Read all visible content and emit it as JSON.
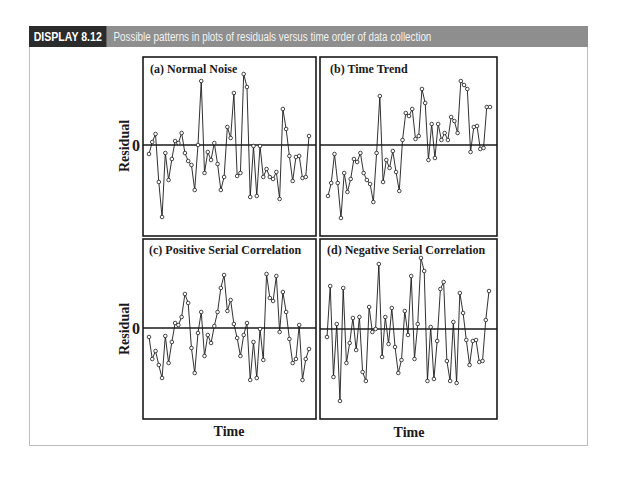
{
  "header": {
    "tag": "DISPLAY 8.12",
    "caption": "Possible patterns in plots of residuals versus time order of data collection"
  },
  "axes": {
    "ylabel": "Residual",
    "xlabel": "Time",
    "zero_tick": "0"
  },
  "colors": {
    "header_bg": "#8e8e8e",
    "tag_bg": "#2b2b2b",
    "line": "#1a1a1a"
  },
  "chart_data": [
    {
      "type": "line",
      "title": "(a) Normal Noise",
      "xlabel": "Time",
      "ylabel": "Residual",
      "grid": false,
      "reference_line": 0,
      "note": "values are residuals in pixel-relative units (positive = above zero line)",
      "x": [
        1,
        2,
        3,
        4,
        5,
        6,
        7,
        8,
        9,
        10,
        11,
        12,
        13,
        14,
        15,
        16,
        17,
        18,
        19,
        20,
        21,
        22,
        23,
        24,
        25,
        26,
        27,
        28,
        29,
        30,
        31,
        32,
        33,
        34,
        35,
        36,
        37,
        38,
        39,
        40,
        41,
        42,
        43,
        44,
        45,
        46,
        47,
        48,
        49,
        50
      ],
      "values": [
        -9,
        3,
        11,
        -37,
        -72,
        -8,
        -35,
        -14,
        4,
        2,
        12,
        -8,
        -16,
        -20,
        -45,
        0,
        64,
        -28,
        -7,
        -15,
        2,
        -19,
        -45,
        -32,
        18,
        7,
        52,
        -31,
        -28,
        71,
        58,
        -52,
        -1,
        -51,
        -1,
        -32,
        -24,
        -32,
        -34,
        -27,
        -54,
        36,
        16,
        -11,
        -36,
        -12,
        -11,
        -33,
        -32,
        9
      ]
    },
    {
      "type": "line",
      "title": "(b) Time Trend",
      "xlabel": "Time",
      "ylabel": "Residual",
      "grid": false,
      "reference_line": 0,
      "x": [
        1,
        2,
        3,
        4,
        5,
        6,
        7,
        8,
        9,
        10,
        11,
        12,
        13,
        14,
        15,
        16,
        17,
        18,
        19,
        20,
        21,
        22,
        23,
        24,
        25,
        26,
        27,
        28,
        29,
        30,
        31,
        32,
        33,
        34,
        35,
        36,
        37,
        38,
        39,
        40,
        41,
        42,
        43,
        44,
        45,
        46,
        47,
        48,
        49,
        50,
        51
      ],
      "values": [
        -51,
        -38,
        -9,
        -38,
        -73,
        -28,
        -47,
        -34,
        -14,
        -17,
        -8,
        -28,
        -35,
        -39,
        -57,
        -8,
        49,
        -37,
        -15,
        -23,
        -6,
        -27,
        -46,
        5,
        32,
        29,
        36,
        6,
        9,
        56,
        42,
        -15,
        21,
        -13,
        21,
        5,
        12,
        5,
        28,
        24,
        12,
        64,
        60,
        56,
        -7,
        18,
        19,
        -4,
        -3,
        38,
        38
      ],
      "values_note": "last duplicate point approximated"
    },
    {
      "type": "line",
      "title": "(c) Positive Serial Correlation",
      "xlabel": "Time",
      "ylabel": "Residual",
      "grid": false,
      "reference_line": 0,
      "x": [
        1,
        2,
        3,
        4,
        5,
        6,
        7,
        8,
        9,
        10,
        11,
        12,
        13,
        14,
        15,
        16,
        17,
        18,
        19,
        20,
        21,
        22,
        23,
        24,
        25,
        26,
        27,
        28,
        29,
        30,
        31,
        32,
        33,
        34,
        35,
        36,
        37,
        38,
        39,
        40,
        41,
        42,
        43,
        44,
        45,
        46,
        47,
        48,
        49,
        50
      ],
      "values": [
        -9,
        -31,
        -23,
        -37,
        -50,
        -8,
        -35,
        -14,
        5,
        3,
        11,
        34,
        25,
        -20,
        -45,
        -5,
        16,
        -28,
        -7,
        -15,
        2,
        16,
        40,
        53,
        17,
        28,
        4,
        -10,
        -28,
        -7,
        5,
        -52,
        -14,
        -50,
        -1,
        -32,
        54,
        30,
        27,
        52,
        -4,
        36,
        16,
        -11,
        -35,
        -31,
        3,
        -52,
        -31,
        -21
      ]
    },
    {
      "type": "line",
      "title": "(d) Negative Serial Correlation",
      "xlabel": "Time",
      "ylabel": "Residual",
      "grid": false,
      "reference_line": 0,
      "x": [
        1,
        2,
        3,
        4,
        5,
        6,
        7,
        8,
        9,
        10,
        11,
        12,
        13,
        14,
        15,
        16,
        17,
        18,
        19,
        20,
        21,
        22,
        23,
        24,
        25,
        26,
        27,
        28,
        29,
        30,
        31,
        32,
        33,
        34,
        35,
        36,
        37,
        38,
        39,
        40,
        41,
        42,
        43,
        44,
        45,
        46,
        47,
        48,
        49,
        50,
        51
      ],
      "values": [
        -8,
        43,
        -48,
        5,
        -72,
        41,
        -34,
        -14,
        11,
        -21,
        12,
        -43,
        -52,
        22,
        -3,
        0,
        65,
        -28,
        12,
        -15,
        21,
        -18,
        -44,
        -31,
        18,
        -6,
        53,
        -30,
        5,
        71,
        58,
        -52,
        2,
        -50,
        -12,
        40,
        47,
        -32,
        -52,
        7,
        -54,
        36,
        16,
        -11,
        -36,
        -12,
        -11,
        -33,
        -32,
        9,
        38
      ],
      "values_note": "approximate"
    }
  ],
  "panels": [
    {
      "title": "(a) Normal Noise"
    },
    {
      "title": "(b) Time Trend"
    },
    {
      "title": "(c) Positive Serial Correlation"
    },
    {
      "title": "(d) Negative Serial Correlation"
    }
  ]
}
